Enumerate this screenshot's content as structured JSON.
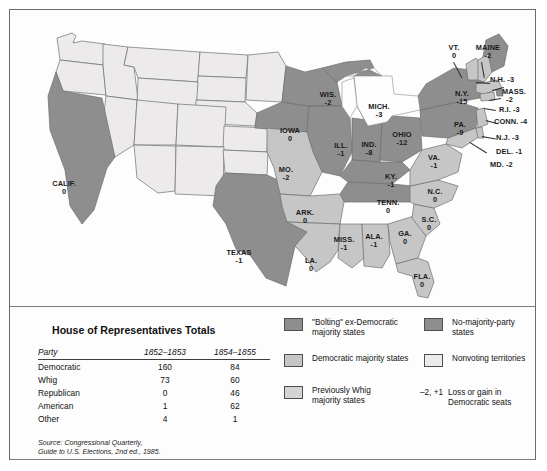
{
  "map": {
    "title": "United States House of Representatives 1854-1855 party map",
    "states": [
      {
        "name": "CALIF.",
        "value": "0",
        "cls": "bolt",
        "x": 52,
        "y": 174
      },
      {
        "name": "TEXAS",
        "value": "-1",
        "cls": "bolt",
        "x": 228,
        "y": 243
      },
      {
        "name": "IOWA",
        "value": "0",
        "cls": "bolt",
        "x": 281,
        "y": 120
      },
      {
        "name": "MO.",
        "value": "-2",
        "cls": "demo",
        "x": 277,
        "y": 160
      },
      {
        "name": "ARK.",
        "value": "0",
        "cls": "demo",
        "x": 295,
        "y": 203
      },
      {
        "name": "LA.",
        "value": "0",
        "cls": "demo",
        "x": 302,
        "y": 252
      },
      {
        "name": "MISS.",
        "value": "-1",
        "cls": "demo",
        "x": 333,
        "y": 230
      },
      {
        "name": "WIS.",
        "value": "-2",
        "cls": "bolt",
        "x": 318,
        "y": 85
      },
      {
        "name": "ILL.",
        "value": "-1",
        "cls": "bolt",
        "x": 331,
        "y": 136
      },
      {
        "name": "IND.",
        "value": "-8",
        "cls": "bolt",
        "x": 358,
        "y": 135
      },
      {
        "name": "MICH.",
        "value": "-3",
        "cls": "bolt",
        "x": 368,
        "y": 97
      },
      {
        "name": "OHIO",
        "value": "-12",
        "cls": "bolt",
        "x": 392,
        "y": 125
      },
      {
        "name": "KY.",
        "value": "-1",
        "cls": "bolt",
        "x": 381,
        "y": 167
      },
      {
        "name": "TENN.",
        "value": "0",
        "cls": "bolt",
        "x": 378,
        "y": 193
      },
      {
        "name": "ALA.",
        "value": "-1",
        "cls": "demo",
        "x": 364,
        "y": 227
      },
      {
        "name": "GA.",
        "value": "0",
        "cls": "demo",
        "x": 395,
        "y": 224
      },
      {
        "name": "S.C.",
        "value": "0",
        "cls": "demo",
        "x": 419,
        "y": 210
      },
      {
        "name": "N.C.",
        "value": "0",
        "cls": "demo",
        "x": 425,
        "y": 182
      },
      {
        "name": "FLA.",
        "value": "0",
        "cls": "demo",
        "x": 412,
        "y": 267
      },
      {
        "name": "VA.",
        "value": "-1",
        "cls": "demo",
        "x": 423,
        "y": 148
      },
      {
        "name": "PA.",
        "value": "-9",
        "cls": "bolt",
        "x": 450,
        "y": 115
      },
      {
        "name": "N.Y.",
        "value": "-15",
        "cls": "bolt",
        "x": 452,
        "y": 84
      },
      {
        "name": "VT.",
        "value": "0",
        "cls": "demo",
        "x": 444,
        "y": 38
      },
      {
        "name": "MAINE",
        "value": "-2",
        "cls": "bolt",
        "x": 478,
        "y": 38
      }
    ],
    "callouts": [
      {
        "label": "N.H. -3",
        "x": 481,
        "y": 69
      },
      {
        "label": "MASS.\n-2",
        "x": 497,
        "y": 83
      },
      {
        "label": "R.I. -3",
        "x": 492,
        "y": 99
      },
      {
        "label": "CONN. -4",
        "x": 486,
        "y": 110
      },
      {
        "label": "N.J. -3",
        "x": 488,
        "y": 127
      },
      {
        "label": "DEL. -1",
        "x": 488,
        "y": 141
      },
      {
        "label": "MD. -2",
        "x": 484,
        "y": 154
      }
    ]
  },
  "table": {
    "title": "House of Representatives Totals",
    "headers": [
      "Party",
      "1852–1853",
      "1854–1855"
    ],
    "rows": [
      {
        "party": "Democratic",
        "a": "160",
        "b": "84"
      },
      {
        "party": "Whig",
        "a": "73",
        "b": "60"
      },
      {
        "party": "Republican",
        "a": "0",
        "b": "46"
      },
      {
        "party": "American",
        "a": "1",
        "b": "62"
      },
      {
        "party": "Other",
        "a": "4",
        "b": "1"
      }
    ],
    "source_line1": "Source: Congressional Quarterly,",
    "source_line2": "Guide to U.S. Elections, 2nd ed., 1985."
  },
  "legend": {
    "items": [
      {
        "swatch": "#8e8e8e",
        "label": "\"Bolting\" ex-Democratic\nmajority states"
      },
      {
        "swatch": "#c6c6c6",
        "label": "Democratic majority states"
      },
      {
        "swatch": "#d4d4d4",
        "label": "Previously Whig\nmajority states"
      },
      {
        "swatch": "#8e8e8e",
        "label": "No-majority-party\nstates"
      },
      {
        "swatch": "#eceaea",
        "label": "Nonvoting territories"
      }
    ],
    "seat_key_symbol": "–2, +1",
    "seat_key_label": "Loss or gain in\nDemocratic seats"
  },
  "colors": {
    "bolting": "#8e8e8e",
    "democratic": "#c6c6c6",
    "prev_whig": "#d4d4d4",
    "no_majority": "#8e8e8e",
    "territory": "#eceaea",
    "outline": "#6f6f6f",
    "text": "#111111"
  }
}
